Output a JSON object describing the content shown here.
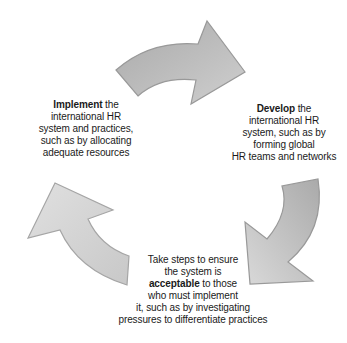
{
  "diagram": {
    "type": "cycle",
    "colors": {
      "arrow_top": "#b3b3b3",
      "arrow_right": "#bdbdbd",
      "arrow_left": "#d6d6d6",
      "arrow_stroke": "#9a9a9a",
      "text": "#1a1a1a"
    },
    "steps": [
      {
        "id": "develop",
        "keyword": "Develop",
        "lines": [
          "the",
          "international HR",
          "system, such as by",
          "forming global",
          "HR teams and networks"
        ]
      },
      {
        "id": "acceptable",
        "lines_before": [
          "Take steps to ensure",
          "the system is"
        ],
        "keyword": "acceptable",
        "keyword_suffix": "to those",
        "lines_after": [
          "who must implement",
          "it, such as by investigating",
          "pressures to differentiate practices"
        ]
      },
      {
        "id": "implement",
        "keyword": "Implement",
        "lines": [
          "the",
          "international HR",
          "system and practices,",
          "such as by allocating",
          "adequate resources"
        ]
      }
    ],
    "arrows": [
      {
        "position": "top",
        "direction": "clockwise",
        "from": "implement",
        "to": "develop"
      },
      {
        "position": "right",
        "direction": "clockwise",
        "from": "develop",
        "to": "acceptable"
      },
      {
        "position": "left",
        "direction": "clockwise",
        "from": "acceptable",
        "to": "implement"
      }
    ]
  }
}
